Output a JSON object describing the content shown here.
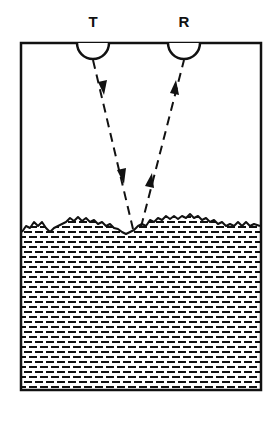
{
  "diagram": {
    "type": "ultrasonic-level-sensor",
    "labels": {
      "transmitter": "T",
      "receiver": "R"
    },
    "components": [
      {
        "id": "transmitter",
        "label": "T",
        "shape": "semicircle",
        "cx": 93,
        "cy": 43,
        "r": 16
      },
      {
        "id": "receiver",
        "label": "R",
        "shape": "semicircle",
        "cx": 184,
        "cy": 43,
        "r": 16
      }
    ],
    "container": {
      "x": 21,
      "y": 43,
      "width": 240,
      "height": 347
    },
    "liquid_surface_y": 222,
    "rays": [
      {
        "id": "incident",
        "from": [
          93,
          59
        ],
        "to": [
          133,
          230
        ],
        "direction": "down"
      },
      {
        "id": "reflected",
        "from": [
          141,
          228
        ],
        "to": [
          184,
          59
        ],
        "direction": "up"
      }
    ],
    "colors": {
      "ink": "#111111",
      "background": "#ffffff"
    }
  }
}
